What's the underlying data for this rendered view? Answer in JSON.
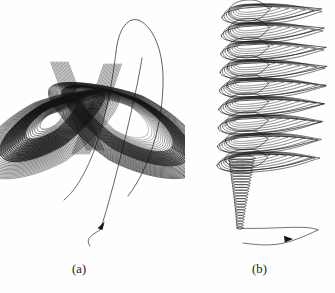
{
  "figure": {
    "background_color": "#fefefe",
    "line_color": "#141414",
    "panels": [
      {
        "id": "a",
        "caption": "(a)",
        "attractor_name": "Lorenz attractor",
        "description": "Butterfly-shaped double-lobe chaotic attractor with dense left lobe and open right lobe, plus a transient trajectory entering from below with an arrowhead."
      },
      {
        "id": "b",
        "caption": "(b)",
        "attractor_name": "Rossler-type attractor",
        "description": "Stacked elongated spiral loops forming a vertical funnel, with a tight expanding helix transient at the base and an incoming arc with an arrowhead."
      }
    ]
  },
  "chart_data": {
    "type": "line",
    "title": "",
    "xlabel": "",
    "ylabel": "",
    "grid": false,
    "legend": "none",
    "panels": [
      {
        "id": "a",
        "caption": "(a)",
        "name": "Lorenz attractor projection",
        "system": "Lorenz",
        "equations": [
          "dx/dt = sigma*(y - x)",
          "dy/dt = x*(rho - z) - y",
          "dz/dt = x*y - beta*z"
        ],
        "parameters": {
          "sigma": 10,
          "rho": 28,
          "beta": 2.6667
        },
        "initial_condition": [
          0.6,
          0.6,
          0.6
        ],
        "lobe_centers": [
          [
            52,
            120
          ],
          [
            122,
            118
          ]
        ],
        "lobe_density": {
          "left": "dense-dark",
          "right": "open-white-core"
        },
        "orbit_count": 34,
        "transient": {
          "start": [
            90,
            246
          ],
          "end": [
            142,
            58
          ],
          "arrow_at": [
            101,
            227
          ],
          "arrow_direction": "up-right"
        },
        "xlim": [
          0,
          185
        ],
        "ylim": [
          0,
          255
        ]
      },
      {
        "id": "b",
        "caption": "(b)",
        "name": "Rossler-type attractor projection",
        "system": "Rossler",
        "equations": [
          "dx/dt = -y - z",
          "dy/dt = x + a*y",
          "dz/dt = b + z*(x - c)"
        ],
        "parameters": {
          "a": 0.2,
          "b": 0.2,
          "c": 5.7
        },
        "initial_condition": [
          0.1,
          0.1,
          0.1
        ],
        "loop_count": 9,
        "loop_shape": "elongated ellipse with rounded left cap and long thin right tail",
        "funnel_top_y": 12,
        "funnel_bottom_y": 160,
        "helix": {
          "turns": 26,
          "top": [
            242,
            158
          ],
          "bottom": [
            240,
            228
          ],
          "width_top": 26,
          "width_bottom": 6
        },
        "transient": {
          "start": [
            243,
            243
          ],
          "end": [
            318,
            230
          ],
          "arrow_at": [
            286,
            240
          ],
          "arrow_direction": "right"
        },
        "xlim": [
          0,
          140
        ],
        "ylim": [
          0,
          255
        ]
      }
    ]
  }
}
